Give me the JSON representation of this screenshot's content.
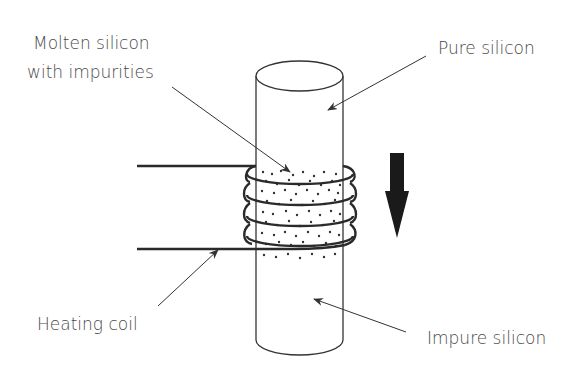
{
  "diagram": {
    "labels": {
      "molten_line1": "Molten silicon",
      "molten_line2": "with impurities",
      "pure": "Pure silicon",
      "heating_coil": "Heating coil",
      "impure": "Impure silicon"
    },
    "colors": {
      "line": "#333333",
      "text": "#4a4a4a",
      "arrow": "#1a1a1a",
      "background": "#ffffff"
    },
    "direction_arrow": "down"
  }
}
